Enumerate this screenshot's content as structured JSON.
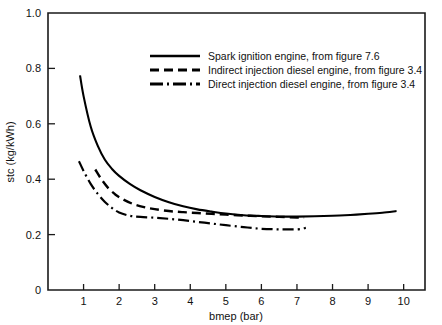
{
  "chart_data": {
    "type": "line",
    "title": "",
    "subtitle": "",
    "xlabel": "bmep (bar)",
    "ylabel": "stc (kg/kWh)",
    "xlim": [
      0,
      10.6
    ],
    "ylim": [
      0,
      1.0
    ],
    "grid": false,
    "legend_position": "upper-center",
    "xticks": [
      1,
      2,
      3,
      4,
      5,
      6,
      7,
      8,
      9,
      10
    ],
    "xticklabels": [
      "1",
      "2",
      "3",
      "4",
      "5",
      "6",
      "7",
      "8",
      "9",
      "10"
    ],
    "yticks": [
      0,
      0.2,
      0.4,
      0.6,
      0.8,
      1.0
    ],
    "yticklabels": [
      "0",
      "0.2",
      "0.4",
      "0.6",
      "0.8",
      "1.0"
    ],
    "series": [
      {
        "name": "Spark ignition engine, from figure 7.6",
        "style": "solid",
        "color": "#000000",
        "x": [
          0.9,
          1.0,
          1.2,
          1.4,
          1.6,
          1.8,
          2.0,
          2.3,
          2.6,
          3.0,
          3.4,
          3.8,
          4.2,
          4.6,
          5.0,
          5.5,
          6.0,
          6.5,
          7.0,
          7.5,
          8.0,
          8.5,
          9.0,
          9.4,
          9.8
        ],
        "y": [
          0.775,
          0.7,
          0.59,
          0.52,
          0.47,
          0.437,
          0.412,
          0.383,
          0.36,
          0.336,
          0.317,
          0.302,
          0.291,
          0.283,
          0.276,
          0.27,
          0.267,
          0.265,
          0.265,
          0.266,
          0.268,
          0.271,
          0.275,
          0.279,
          0.285
        ]
      },
      {
        "name": "Indirect injection diesel engine, from figure 3.4",
        "style": "dashed",
        "color": "#000000",
        "x": [
          1.33,
          1.5,
          1.7,
          1.9,
          2.1,
          2.4,
          2.7,
          3.0,
          3.4,
          3.8,
          4.2,
          4.6,
          5.0,
          5.5,
          6.0,
          6.5,
          7.0,
          7.2
        ],
        "y": [
          0.435,
          0.4,
          0.367,
          0.344,
          0.328,
          0.31,
          0.299,
          0.292,
          0.285,
          0.281,
          0.278,
          0.275,
          0.272,
          0.269,
          0.266,
          0.264,
          0.262,
          0.262
        ]
      },
      {
        "name": "Direct injection diesel engine, from figure 3.4",
        "style": "dash-dot",
        "color": "#000000",
        "x": [
          0.87,
          1.0,
          1.2,
          1.4,
          1.6,
          1.8,
          2.0,
          2.3,
          2.6,
          3.0,
          3.4,
          3.8,
          4.2,
          4.6,
          5.0,
          5.5,
          6.0,
          6.5,
          7.0,
          7.25
        ],
        "y": [
          0.465,
          0.43,
          0.383,
          0.347,
          0.318,
          0.296,
          0.28,
          0.268,
          0.264,
          0.261,
          0.257,
          0.252,
          0.246,
          0.24,
          0.234,
          0.227,
          0.221,
          0.219,
          0.219,
          0.224
        ]
      }
    ],
    "legend_entries": [
      "Spark ignition engine, from figure 7.6",
      "Indirect injection diesel engine, from figure 3.4",
      "Direct injection diesel engine, from figure 3.4"
    ]
  }
}
